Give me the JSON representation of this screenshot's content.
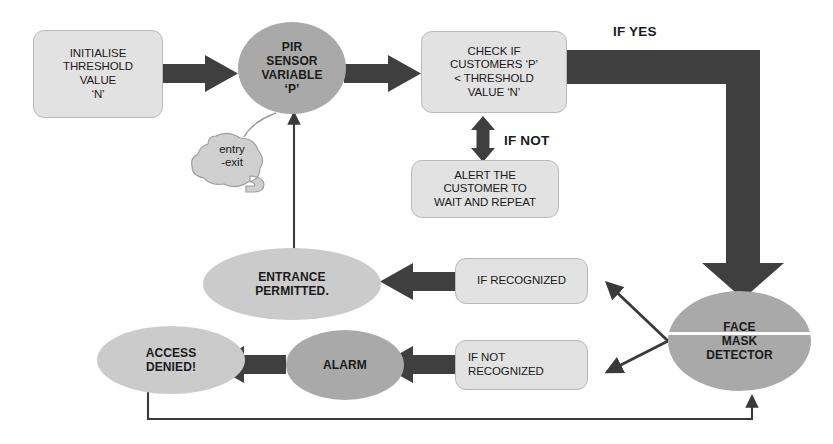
{
  "diagram": {
    "colors": {
      "background": "#ffffff",
      "box_fill": "#e2e2e2",
      "box_border": "#b9b9b9",
      "ellipse_mid": "#a9a9a9",
      "ellipse_light": "#cbcbcb",
      "arrow_thick": "#3f3f3f",
      "arrow_thin": "#3a3a3a",
      "text": "#1a1a1a"
    },
    "nodes": {
      "initialise": {
        "text": "INITIALISE\nTHRESHOLD\nVALUE\n‘N’",
        "shape": "rounded-rectangle"
      },
      "pir_sensor": {
        "text": "PIR\nSENSOR\nVARIABLE\n‘P’",
        "shape": "ellipse"
      },
      "entry_exit": {
        "text": "entry\n-exit",
        "shape": "cloud-callout"
      },
      "check_threshold": {
        "text": "CHECK IF\nCUSTOMERS ‘P’\n< THRESHOLD\nVALUE ‘N’",
        "shape": "rounded-rectangle"
      },
      "alert_customer": {
        "text": "ALERT THE\nCUSTOMER TO\nWAIT AND REPEAT",
        "shape": "rounded-rectangle"
      },
      "face_mask_detector": {
        "text": "FACE\nMASK\nDETECTOR",
        "shape": "ellipse"
      },
      "if_recognized": {
        "text": "IF RECOGNIZED",
        "shape": "rounded-rectangle"
      },
      "if_not_recognized": {
        "text": "IF NOT\nRECOGNIZED",
        "shape": "rounded-rectangle"
      },
      "entrance_permitted": {
        "text": "ENTRANCE\nPERMITTED.",
        "shape": "ellipse"
      },
      "alarm": {
        "text": "ALARM",
        "shape": "ellipse"
      },
      "access_denied": {
        "text": "ACCESS\nDENIED!",
        "shape": "ellipse"
      }
    },
    "labels": {
      "if_yes": "IF YES",
      "if_not": "IF NOT"
    },
    "edges": [
      {
        "from": "initialise",
        "to": "pir_sensor",
        "style": "thick-arrow",
        "direction": "right"
      },
      {
        "from": "pir_sensor",
        "to": "check_threshold",
        "style": "thick-arrow",
        "direction": "right"
      },
      {
        "from": "entry_exit",
        "to": "pir_sensor",
        "style": "callout-tail",
        "direction": "none"
      },
      {
        "from": "check_threshold",
        "to": "alert_customer",
        "style": "thick-double-arrow",
        "direction": "both",
        "label": "IF NOT"
      },
      {
        "from": "check_threshold",
        "to": "face_mask_detector",
        "style": "thick-elbow-arrow",
        "direction": "down",
        "label": "IF YES"
      },
      {
        "from": "face_mask_detector",
        "to": "if_recognized",
        "style": "thin-arrow",
        "direction": "up-left"
      },
      {
        "from": "face_mask_detector",
        "to": "if_not_recognized",
        "style": "thin-arrow",
        "direction": "down-left"
      },
      {
        "from": "if_recognized",
        "to": "entrance_permitted",
        "style": "thick-arrow",
        "direction": "left"
      },
      {
        "from": "if_not_recognized",
        "to": "alarm",
        "style": "thick-arrow",
        "direction": "left"
      },
      {
        "from": "alarm",
        "to": "access_denied",
        "style": "thick-arrow",
        "direction": "left"
      },
      {
        "from": "entrance_permitted",
        "to": "pir_sensor",
        "style": "thin-arrow",
        "direction": "up"
      },
      {
        "from": "access_denied",
        "to": "face_mask_detector",
        "style": "thin-elbow-arrow",
        "direction": "up"
      }
    ]
  }
}
